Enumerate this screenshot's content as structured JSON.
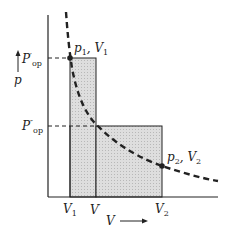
{
  "diagram": {
    "type": "pV work diagram",
    "axes": {
      "x_label": "V",
      "y_label": "p"
    },
    "y_ticks": [
      {
        "base": "P",
        "prime": "′",
        "sub": "op"
      },
      {
        "base": "P",
        "prime": "″",
        "sub": "op"
      }
    ],
    "x_ticks": [
      {
        "base": "V",
        "sub": "1"
      },
      {
        "base": "V",
        "prime": "′"
      },
      {
        "base": "V",
        "sub": "2"
      }
    ],
    "points": [
      {
        "p": "p",
        "p_sub": "1",
        "v": "V",
        "v_sub": "1"
      },
      {
        "p": "p",
        "p_sub": "2",
        "v": "V",
        "v_sub": "2"
      }
    ],
    "colors": {
      "line": "#222222",
      "shade": "#d4d4d4"
    }
  }
}
